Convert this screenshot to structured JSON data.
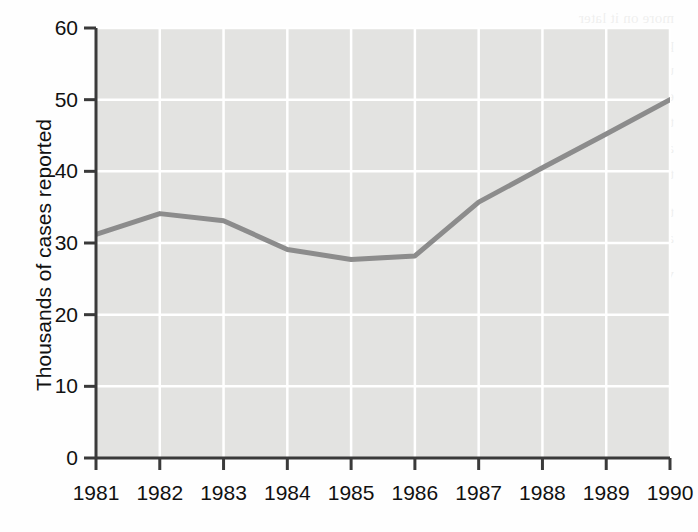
{
  "chart_data": {
    "type": "line",
    "title": "",
    "subtitle": "",
    "xlabel": "",
    "ylabel": "Thousands of cases reported",
    "categories": [
      "1981",
      "1982",
      "1983",
      "1984",
      "1985",
      "1986",
      "1987",
      "1988",
      "1989",
      "1990"
    ],
    "x": [
      1981,
      1982,
      1983,
      1984,
      1985,
      1986,
      1987,
      1988,
      1989,
      1990
    ],
    "values": [
      31.2,
      34.1,
      33.1,
      29.1,
      27.7,
      28.2,
      35.7,
      40.5,
      45.2,
      50.0
    ],
    "series": [
      {
        "name": "Thousands of cases reported",
        "values": [
          31.2,
          34.1,
          33.1,
          29.1,
          27.7,
          28.2,
          35.7,
          40.5,
          45.2,
          50.0
        ]
      }
    ],
    "xlim": [
      1981,
      1990
    ],
    "ylim": [
      0,
      60
    ],
    "yticks": [
      0,
      10,
      20,
      30,
      40,
      50,
      60
    ],
    "ytick_labels": [
      "0",
      "10",
      "20",
      "30",
      "40",
      "50",
      "60"
    ],
    "xticks": [
      1981,
      1982,
      1983,
      1984,
      1985,
      1986,
      1987,
      1988,
      1989,
      1990
    ],
    "xtick_labels": [
      "1981",
      "1982",
      "1983",
      "1984",
      "1985",
      "1986",
      "1987",
      "1988",
      "1989",
      "1990"
    ],
    "grid": true,
    "grid_color": "#ffffff",
    "plot_background": "#e3e3e1",
    "line_color": "#8c8c8c",
    "line_width": 5,
    "axis_color": "#3a3a3a",
    "legend": null,
    "legend_position": "none",
    "annotations": []
  },
  "bleed_text": {
    "lines": [
      "more on it later",
      "phrases are more flexible — table C. is best. If it",
      "use the same emphasized there too ? the",
      "example. That sentence is just used to follow",
      "the list of the little format; dollars about 1982",
      "and the entire structure with a structure cost",
      "to call it. Case by case number coming out",
      "",
      "that part of the series to review of all the room",
      "about the same method of the later parts",
      "valid. Table 14.3 on table about that. Hypothe-"
    ]
  }
}
